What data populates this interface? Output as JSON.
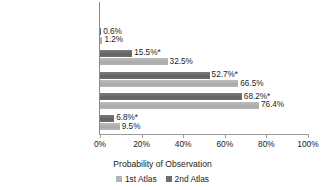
{
  "chart_data": {
    "type": "bar",
    "orientation": "horizontal",
    "title": "",
    "xlabel": "Probability of Observation",
    "ylabel": "",
    "xlim": [
      0,
      100
    ],
    "xtick_labels": [
      "0%",
      "20%",
      "40%",
      "60%",
      "80%",
      "100%"
    ],
    "xtick_values": [
      0,
      20,
      40,
      60,
      80,
      100
    ],
    "grid": false,
    "legend_position": "bottom",
    "categories": [
      "Hudson Bay Lowlands",
      "Northern Shield",
      "Southern Shield",
      "Lake Simcoe-Rideau",
      "Carolinian",
      "Ontario"
    ],
    "series": [
      {
        "name": "2nd Atlas",
        "color": "#6f6f6f",
        "values": [
          null,
          0.6,
          15.5,
          52.7,
          68.2,
          6.8
        ],
        "labels": [
          "",
          "0.6%",
          "15.5%*",
          "52.7%*",
          "68.2%*",
          "6.8%*"
        ]
      },
      {
        "name": "1st Atlas",
        "color": "#b3b3b3",
        "values": [
          null,
          1.2,
          32.5,
          66.5,
          76.4,
          9.5
        ],
        "labels": [
          "",
          "1.2%",
          "32.5%",
          "66.5%",
          "76.4%",
          "9.5%"
        ]
      }
    ]
  },
  "legend": {
    "items": [
      {
        "label": "1st Atlas",
        "swatch": "legend-swatch-1st-atlas"
      },
      {
        "label": "2nd Atlas",
        "swatch": "legend-swatch-2nd-atlas"
      }
    ]
  }
}
